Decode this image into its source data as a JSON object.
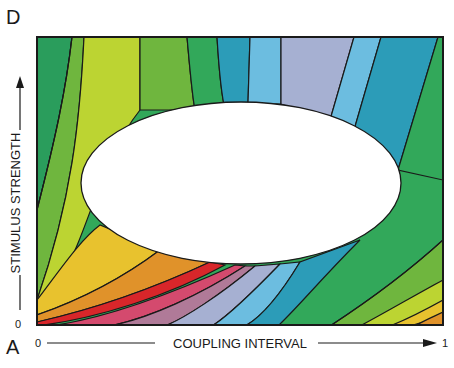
{
  "panel_labels": {
    "top": "D",
    "bottom": "A"
  },
  "axes": {
    "x_label": "COUPLING INTERVAL",
    "x_min_tick": "0",
    "x_max_tick": "1",
    "y_label": "STIMULUS STRENGTH",
    "y_min_tick": "0"
  },
  "colors": {
    "dark_green": "#2a9d5c",
    "mid_green": "#6fb63e",
    "yellow_green": "#bcd432",
    "yellow": "#e8c22e",
    "orange": "#e0922a",
    "red": "#d8262a",
    "pink": "#d44a6e",
    "mauve": "#b07a98",
    "lavender": "#a6b0d2",
    "light_blue": "#6cbde0",
    "teal": "#2c9cb8",
    "green": "#32a85a",
    "outline": "#1a1a1a",
    "hole": "#ffffff"
  }
}
